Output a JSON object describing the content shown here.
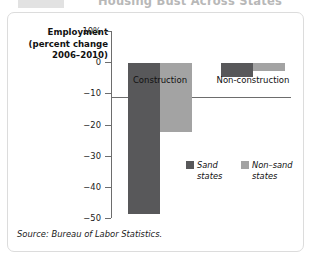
{
  "banner": {
    "title": "Housing Bust Across States"
  },
  "figure": {
    "axis_title_lines": [
      "Employment",
      "(percent change",
      "2006–2010)"
    ],
    "source": "Source: Bureau of Labor Statistics."
  },
  "chart_data": {
    "type": "bar",
    "title": "Housing Bust Across States",
    "xlabel": "",
    "ylabel": "Employment (percent change 2006–2010)",
    "ylim": [
      -50,
      10
    ],
    "yticks": [
      10,
      0,
      -10,
      -20,
      -30,
      -40,
      -50
    ],
    "ytick_labels": [
      "10%",
      "0",
      "−10",
      "−20",
      "−30",
      "−40",
      "−50"
    ],
    "categories": [
      "Construction",
      "Non-construction"
    ],
    "legend_position": "inside-right",
    "grid": false,
    "series": [
      {
        "name": "Sand states",
        "name_lines": [
          "Sand",
          "states"
        ],
        "color": "#58585a",
        "values": [
          -48.5,
          -4.5
        ]
      },
      {
        "name": "Non–sand states",
        "name_lines": [
          "Non–sand",
          "states"
        ],
        "color": "#a3a3a3",
        "values": [
          -22.0,
          -2.5
        ]
      }
    ]
  }
}
